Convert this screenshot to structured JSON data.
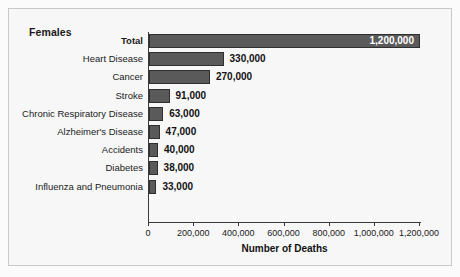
{
  "chart_data": {
    "type": "bar",
    "orientation": "horizontal",
    "title": "Females",
    "xlabel": "Number of Deaths",
    "ylabel": "",
    "categories": [
      "Total",
      "Heart Disease",
      "Cancer",
      "Stroke",
      "Chronic Respiratory Disease",
      "Alzheimer's Disease",
      "Accidents",
      "Diabetes",
      "Influenza and Pneumonia"
    ],
    "values": [
      1200000,
      330000,
      270000,
      91000,
      63000,
      47000,
      40000,
      38000,
      33000
    ],
    "value_labels": [
      "1,200,000",
      "330,000",
      "270,000",
      "91,000",
      "63,000",
      "47,000",
      "40,000",
      "38,000",
      "33,000"
    ],
    "label_placement": [
      "inside",
      "outside",
      "outside",
      "outside",
      "outside",
      "outside",
      "outside",
      "outside",
      "outside"
    ],
    "emphasized_categories": [
      "Total"
    ],
    "xlim": [
      0,
      1200000
    ],
    "xticks": [
      0,
      200000,
      400000,
      600000,
      800000,
      1000000,
      1200000
    ],
    "xtick_labels": [
      "0",
      "200,000",
      "400,000",
      "600,000",
      "800,000",
      "1,000,000",
      "1,200,000"
    ],
    "grid": false,
    "legend": null,
    "bar_color": "#5a5a5a",
    "bar_border_color": "#2f2f2f",
    "axis_color": "#3a3a3a",
    "text_color": "#1a1a1a",
    "plot_background": "#f7f7f7"
  }
}
